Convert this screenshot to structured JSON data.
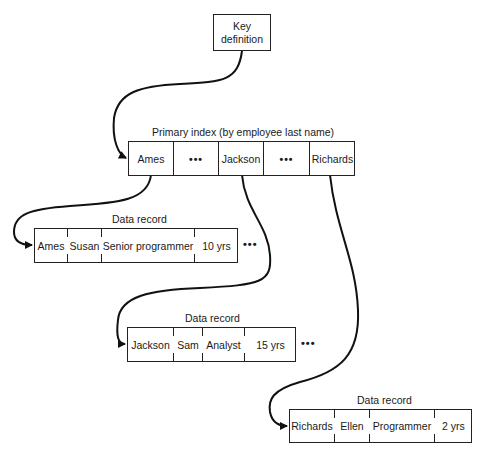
{
  "key_definition": {
    "line1": "Key",
    "line2": "definition"
  },
  "primary_index": {
    "title": "Primary index (by employee last name)",
    "cells": [
      "Ames",
      "•••",
      "Jackson",
      "•••",
      "Richards"
    ]
  },
  "records": [
    {
      "title": "Data record",
      "fields": [
        "Ames",
        "Susan",
        "Senior programmer",
        "10 yrs"
      ],
      "trailing": "•••"
    },
    {
      "title": "Data record",
      "fields": [
        "Jackson",
        "Sam",
        "Analyst",
        "15 yrs"
      ],
      "trailing": "•••"
    },
    {
      "title": "Data record",
      "fields": [
        "Richards",
        "Ellen",
        "Programmer",
        "2 yrs"
      ]
    }
  ],
  "colors": {
    "line": "#111111",
    "background": "#ffffff"
  }
}
